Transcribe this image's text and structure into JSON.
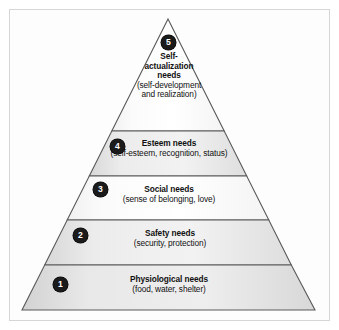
{
  "figure": {
    "frame_color": "#d6d6d6",
    "background_color": "#fdfdfd",
    "outline_color": "#5a5a5a",
    "badge_color": "#1b1b1b",
    "badge_text_color": "#ffffff"
  },
  "pyramid": {
    "apex": {
      "x": 168,
      "y": 19
    },
    "base_left": {
      "x": 22,
      "y": 310
    },
    "base_right": {
      "x": 315,
      "y": 310
    },
    "divider_y": [
      131,
      176,
      220,
      265
    ],
    "tiers": [
      {
        "number": "5",
        "title": "Self-actualization needs",
        "title_lines": [
          "Self-",
          "actualization",
          "needs"
        ],
        "subtitle": "(self-development and realization)",
        "subtitle_lines": [
          "(self-development",
          "and realization)"
        ],
        "fill": "#ffffff"
      },
      {
        "number": "4",
        "title": "Esteem needs",
        "subtitle": "(self-esteem, recognition, status)",
        "fill": "#e9e9e9"
      },
      {
        "number": "3",
        "title": "Social needs",
        "subtitle": "(sense of belonging, love)",
        "fill": "#ffffff"
      },
      {
        "number": "2",
        "title": "Safety needs",
        "subtitle": "(security, protection)",
        "fill": "#e9e9e9"
      },
      {
        "number": "1",
        "title": "Physiological needs",
        "subtitle": "(food, water, shelter)",
        "fill": "#e3e3e3"
      }
    ]
  }
}
